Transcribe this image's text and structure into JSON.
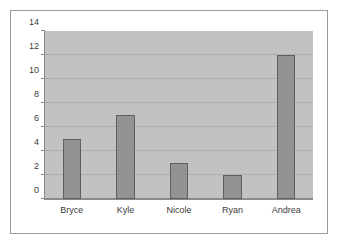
{
  "chart_data": {
    "type": "bar",
    "title": "",
    "subtitle": "",
    "xlabel": "",
    "ylabel": "",
    "categories": [
      "Bryce",
      "Kyle",
      "Nicole",
      "Ryan",
      "Andrea"
    ],
    "values": [
      5,
      7,
      3,
      2,
      12
    ],
    "series": [
      {
        "name": "",
        "values": [
          5,
          7,
          3,
          2,
          12
        ]
      }
    ],
    "ylim": [
      0,
      14
    ],
    "xlim": null,
    "ytick_labels": [
      "0",
      "2",
      "4",
      "6",
      "8",
      "10",
      "12",
      "14"
    ],
    "ytick_values": [
      0,
      2,
      4,
      6,
      8,
      10,
      12,
      14
    ],
    "ytick_step": 2,
    "grid": {
      "horizontal": true,
      "vertical": false
    },
    "legend": {
      "visible": false,
      "position": "none",
      "entries": []
    },
    "annotations": [],
    "data_labels_visible": false,
    "colors": {
      "bar_fill": "#939393",
      "bar_border": "#5e5e5e",
      "plot_background": "#c2c2c2",
      "figure_background": "#ffffff",
      "gridline": "#aeaeae",
      "axis_line": "#8a8a8a",
      "tick_text": "#3b3b3b",
      "frame_border": "#9a9a9a"
    }
  }
}
